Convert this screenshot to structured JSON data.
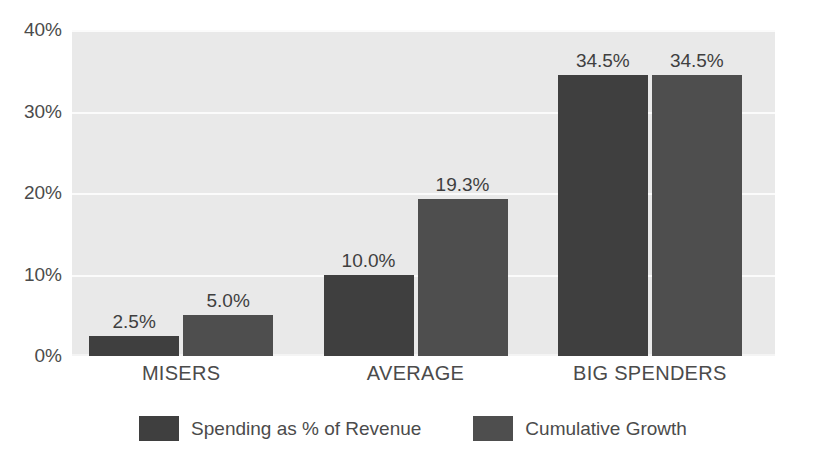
{
  "chart_data": {
    "type": "bar",
    "title": "",
    "xlabel": "",
    "ylabel": "",
    "ylim": [
      0,
      40
    ],
    "ytick_labels": [
      "0%",
      "10%",
      "20%",
      "30%",
      "40%"
    ],
    "ytick_values": [
      0,
      10,
      20,
      30,
      40
    ],
    "grid": true,
    "legend_position": "bottom",
    "categories": [
      "MISERS",
      "AVERAGE",
      "BIG SPENDERS"
    ],
    "series": [
      {
        "name": "Spending as % of Revenue",
        "color": "#3f3f3f",
        "values": [
          2.5,
          10.0,
          34.5
        ],
        "labels": [
          "2.5%",
          "10.0%",
          "34.5%"
        ]
      },
      {
        "name": "Cumulative Growth",
        "color": "#4e4e4e",
        "values": [
          5.0,
          19.3,
          34.5
        ],
        "labels": [
          "5.0%",
          "19.3%",
          "34.5%"
        ]
      }
    ]
  },
  "style": {
    "plot_background": "#e9e9e9",
    "gridline_color": "#fbfbfb",
    "page_background": "#ffffff",
    "text_color": "#4b4b4b"
  }
}
